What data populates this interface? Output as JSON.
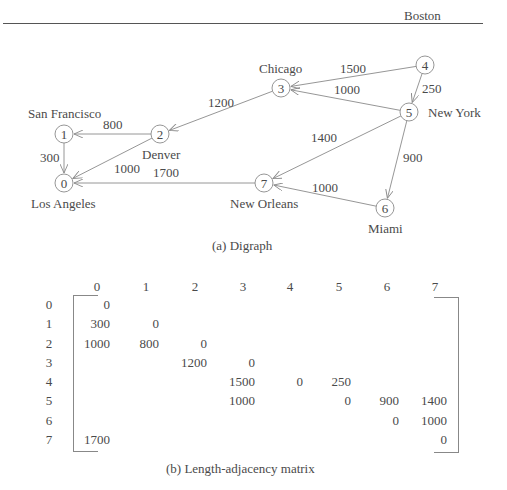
{
  "digraph": {
    "caption": "(a) Digraph",
    "nodes": [
      {
        "id": "0",
        "city": "Los Angeles",
        "x": 64,
        "y": 183
      },
      {
        "id": "1",
        "city": "San Francisco",
        "x": 64,
        "y": 134
      },
      {
        "id": "2",
        "city": "Denver",
        "x": 160,
        "y": 134
      },
      {
        "id": "3",
        "city": "Chicago",
        "x": 281,
        "y": 88
      },
      {
        "id": "4",
        "city": "Boston",
        "x": 425,
        "y": 65
      },
      {
        "id": "5",
        "city": "New York",
        "x": 409,
        "y": 112
      },
      {
        "id": "6",
        "city": "Miami",
        "x": 385,
        "y": 208
      },
      {
        "id": "7",
        "city": "New Orleans",
        "x": 264,
        "y": 183
      }
    ],
    "edges": [
      {
        "from": 1,
        "to": 0,
        "weight": "300"
      },
      {
        "from": 2,
        "to": 0,
        "weight": "1000"
      },
      {
        "from": 2,
        "to": 1,
        "weight": "800"
      },
      {
        "from": 3,
        "to": 2,
        "weight": "1200"
      },
      {
        "from": 4,
        "to": 3,
        "weight": "1500"
      },
      {
        "from": 4,
        "to": 5,
        "weight": "250"
      },
      {
        "from": 5,
        "to": 3,
        "weight": "1000"
      },
      {
        "from": 5,
        "to": 6,
        "weight": "900"
      },
      {
        "from": 5,
        "to": 7,
        "weight": "1400"
      },
      {
        "from": 6,
        "to": 7,
        "weight": "1000"
      },
      {
        "from": 7,
        "to": 0,
        "weight": "1700"
      }
    ]
  },
  "matrix": {
    "caption": "(b) Length-adjacency matrix",
    "col_headers": [
      "0",
      "1",
      "2",
      "3",
      "4",
      "5",
      "6",
      "7"
    ],
    "row_headers": [
      "0",
      "1",
      "2",
      "3",
      "4",
      "5",
      "6",
      "7"
    ],
    "rows": [
      [
        "0",
        "",
        "",
        "",
        "",
        "",
        "",
        ""
      ],
      [
        "300",
        "0",
        "",
        "",
        "",
        "",
        "",
        ""
      ],
      [
        "1000",
        "800",
        "0",
        "",
        "",
        "",
        "",
        ""
      ],
      [
        "",
        "",
        "1200",
        "0",
        "",
        "",
        "",
        ""
      ],
      [
        "",
        "",
        "",
        "1500",
        "0",
        "250",
        "",
        ""
      ],
      [
        "",
        "",
        "",
        "1000",
        "",
        "0",
        "900",
        "1400"
      ],
      [
        "",
        "",
        "",
        "",
        "",
        "",
        "0",
        "1000"
      ],
      [
        "1700",
        "",
        "",
        "",
        "",
        "",
        "",
        "0"
      ]
    ]
  },
  "colors": {
    "line": "#8a8a8a",
    "text": "#4a4a4a"
  }
}
